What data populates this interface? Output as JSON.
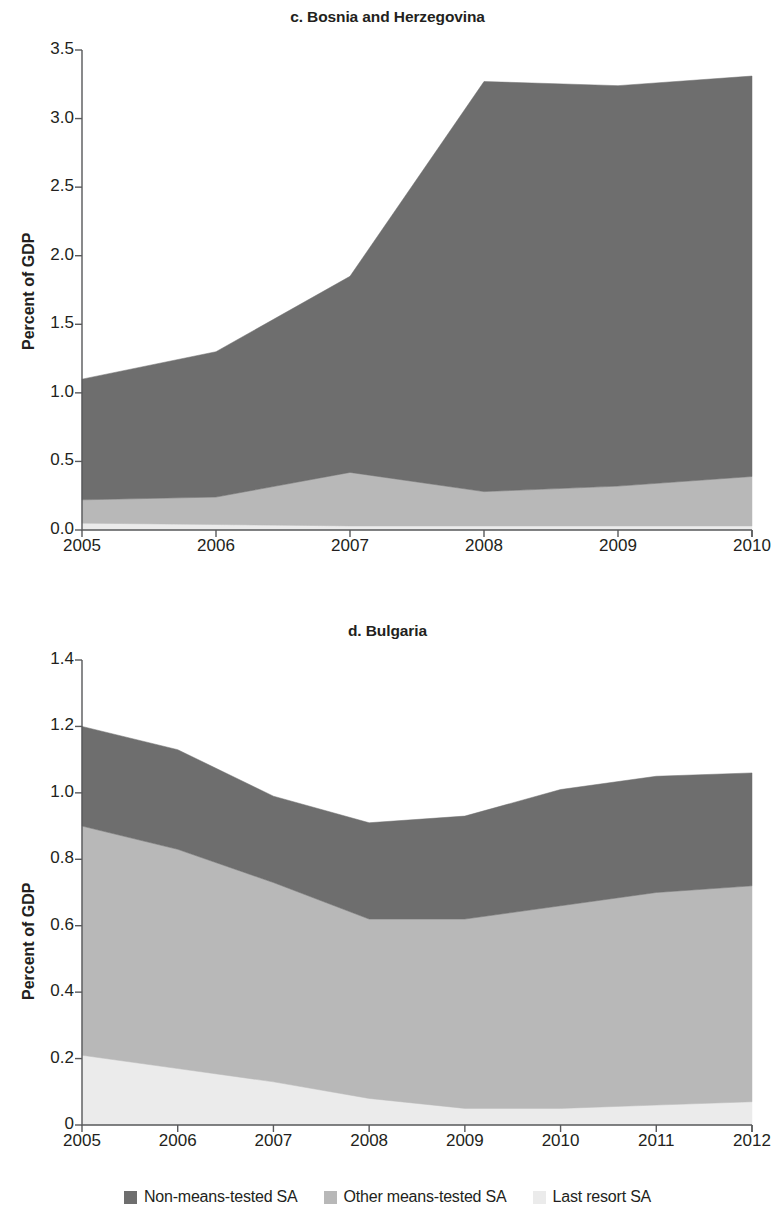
{
  "figure": {
    "y_axis_label": "Percent of GDP",
    "series_colors": {
      "non_means_tested": "#6e6e6e",
      "other_means_tested": "#b8b8b8",
      "last_resort": "#ebebeb"
    },
    "axis_color": "#58595b"
  },
  "legend": {
    "items": [
      {
        "label": "Non-means-tested SA",
        "color": "#6e6e6e",
        "key": "non_means_tested"
      },
      {
        "label": "Other means-tested SA",
        "color": "#b8b8b8",
        "key": "other_means_tested"
      },
      {
        "label": "Last resort SA",
        "color": "#ebebeb",
        "key": "last_resort"
      }
    ]
  },
  "panels": [
    {
      "id": "bosnia",
      "title": "c. Bosnia and Herzegovina",
      "y_axis_label": "Percent of GDP",
      "x_tick_labels": [
        "2005",
        "2006",
        "2007",
        "2008",
        "2009",
        "2010"
      ],
      "y_tick_labels": [
        "0.0",
        "0.5",
        "1.0",
        "1.5",
        "2.0",
        "2.5",
        "3.0",
        "3.5"
      ]
    },
    {
      "id": "bulgaria",
      "title": "d. Bulgaria",
      "y_axis_label": "Percent of GDP",
      "x_tick_labels": [
        "2005",
        "2006",
        "2007",
        "2008",
        "2009",
        "2010",
        "2011",
        "2012"
      ],
      "y_tick_labels": [
        "0",
        "0.2",
        "0.4",
        "0.6",
        "0.8",
        "1.0",
        "1.2",
        "1.4"
      ]
    }
  ],
  "chart_data": [
    {
      "type": "area",
      "id": "bosnia",
      "title": "c. Bosnia and Herzegovina",
      "xlabel": "",
      "ylabel": "Percent of GDP",
      "stacked": true,
      "grid": false,
      "legend_position": "bottom",
      "x": [
        2005,
        2006,
        2007,
        2008,
        2009,
        2010
      ],
      "categories": [
        "2005",
        "2006",
        "2007",
        "2008",
        "2009",
        "2010"
      ],
      "xlim": [
        2005,
        2010
      ],
      "ylim": [
        0.0,
        3.5
      ],
      "yticks": [
        0.0,
        0.5,
        1.0,
        1.5,
        2.0,
        2.5,
        3.0,
        3.5
      ],
      "series": [
        {
          "name": "Last resort SA",
          "color": "#ebebeb",
          "values": [
            0.05,
            0.04,
            0.03,
            0.03,
            0.03,
            0.03
          ]
        },
        {
          "name": "Other means-tested SA",
          "color": "#b8b8b8",
          "values": [
            0.17,
            0.2,
            0.39,
            0.25,
            0.29,
            0.36
          ]
        },
        {
          "name": "Non-means-tested SA",
          "color": "#6e6e6e",
          "values": [
            0.88,
            1.06,
            1.43,
            2.99,
            2.92,
            2.92
          ]
        }
      ],
      "cumulative_totals": [
        1.1,
        1.3,
        1.85,
        3.27,
        3.24,
        3.31
      ]
    },
    {
      "type": "area",
      "id": "bulgaria",
      "title": "d. Bulgaria",
      "xlabel": "",
      "ylabel": "Percent of GDP",
      "stacked": true,
      "grid": false,
      "legend_position": "bottom",
      "x": [
        2005,
        2006,
        2007,
        2008,
        2009,
        2010,
        2011,
        2012
      ],
      "categories": [
        "2005",
        "2006",
        "2007",
        "2008",
        "2009",
        "2010",
        "2011",
        "2012"
      ],
      "xlim": [
        2005,
        2012
      ],
      "ylim": [
        0.0,
        1.4
      ],
      "yticks": [
        0.0,
        0.2,
        0.4,
        0.6,
        0.8,
        1.0,
        1.2,
        1.4
      ],
      "series": [
        {
          "name": "Last resort SA",
          "color": "#ebebeb",
          "values": [
            0.21,
            0.17,
            0.13,
            0.08,
            0.05,
            0.05,
            0.06,
            0.07
          ]
        },
        {
          "name": "Other means-tested SA",
          "color": "#b8b8b8",
          "values": [
            0.69,
            0.66,
            0.6,
            0.54,
            0.57,
            0.61,
            0.64,
            0.65
          ]
        },
        {
          "name": "Non-means-tested SA",
          "color": "#6e6e6e",
          "values": [
            0.3,
            0.3,
            0.26,
            0.29,
            0.31,
            0.35,
            0.35,
            0.34
          ]
        }
      ],
      "cumulative_totals": [
        1.2,
        1.13,
        0.99,
        0.91,
        0.93,
        1.01,
        1.05,
        1.06
      ]
    }
  ]
}
